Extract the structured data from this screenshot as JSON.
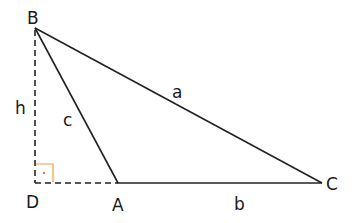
{
  "diagram": {
    "vertices": {
      "B": {
        "label": "B",
        "x": 35,
        "y": 28
      },
      "D": {
        "label": "D",
        "x": 35,
        "y": 183
      },
      "A": {
        "label": "A",
        "x": 118,
        "y": 183
      },
      "C": {
        "label": "C",
        "x": 322,
        "y": 183
      }
    },
    "sides": {
      "a": {
        "label": "a",
        "from": "B",
        "to": "C"
      },
      "b": {
        "label": "b",
        "from": "A",
        "to": "C"
      },
      "c": {
        "label": "c",
        "from": "B",
        "to": "A"
      },
      "h": {
        "label": "h",
        "from": "B",
        "to": "D",
        "style": "dashed"
      },
      "extension": {
        "from": "D",
        "to": "A",
        "style": "dashed"
      }
    },
    "right_angle_marker": {
      "at": "D",
      "color": "#f0a040"
    },
    "colors": {
      "line": "#222222",
      "marker": "#f0a040"
    }
  }
}
